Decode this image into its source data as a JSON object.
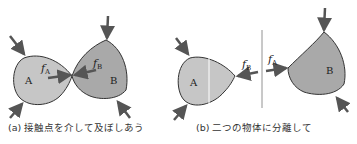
{
  "panel_a": {
    "caption": "(a) 接触点を介して及ぼしあう",
    "body_a_label": "A",
    "body_b_label": "B",
    "force_a_label": "f",
    "force_a_sub": "A",
    "force_b_label": "f",
    "force_b_sub": "B"
  },
  "panel_b": {
    "caption": "(b) 二つの物体に分離して",
    "body_a_label": "A",
    "body_b_label": "B",
    "force_b_label": "f",
    "force_b_sub": "B",
    "force_a_label": "f",
    "force_a_sub": "A"
  },
  "colors": {
    "fill_a": "#c6c6c6",
    "fill_b": "#a9a9a9",
    "arrow": "#555555",
    "outline": "#333333"
  }
}
